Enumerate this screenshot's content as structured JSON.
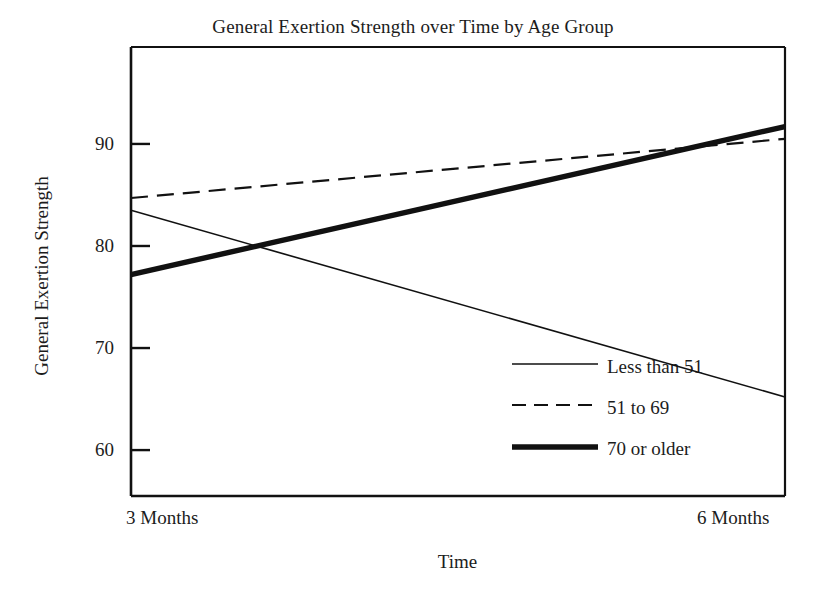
{
  "chart_data": {
    "type": "line",
    "title": "General Exertion Strength over Time by Age Group",
    "xlabel": "Time",
    "ylabel": "General Exertion Strength",
    "categories": [
      "3 Months",
      "6 Months"
    ],
    "x": [
      0,
      1
    ],
    "xtick_labels": [
      "3 Months",
      "6 Months"
    ],
    "ytick_labels": [
      "60",
      "70",
      "80",
      "90"
    ],
    "yticks": [
      60,
      70,
      80,
      90
    ],
    "ylim": [
      55.5,
      99.5
    ],
    "xlim": [
      0,
      1
    ],
    "grid": false,
    "legend_position": "center-right-inside",
    "series": [
      {
        "name": "Less than 51",
        "values": [
          83.5,
          65.2
        ],
        "style": "solid-thin",
        "color": "#111111",
        "width": 1.6
      },
      {
        "name": "51 to 69",
        "values": [
          84.7,
          90.5
        ],
        "style": "dashed",
        "color": "#111111",
        "width": 2.2
      },
      {
        "name": "70 or older",
        "values": [
          77.2,
          91.7
        ],
        "style": "solid-thick",
        "color": "#111111",
        "width": 5.4
      }
    ]
  },
  "title": {
    "text": "General Exertion Strength over Time by Age Group"
  },
  "axes": {
    "y_title": "General Exertion Strength",
    "x_title": "Time",
    "y_ticks": [
      {
        "label": "90"
      },
      {
        "label": "80"
      },
      {
        "label": "70"
      },
      {
        "label": "60"
      }
    ],
    "x_ticks": [
      {
        "label": "3 Months"
      },
      {
        "label": "6 Months"
      }
    ]
  },
  "legend": {
    "items": [
      {
        "label": "Less than 51"
      },
      {
        "label": "51 to 69"
      },
      {
        "label": "70 or older"
      }
    ]
  },
  "colors": {
    "line": "#111111",
    "axis": "#111111",
    "text": "#1c1c1c",
    "background": "#ffffff"
  }
}
